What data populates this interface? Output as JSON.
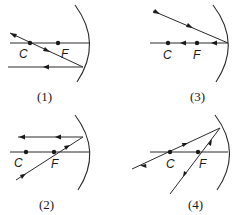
{
  "figure": {
    "panels": [
      {
        "id": "1",
        "label": "(1)",
        "points": {
          "c": "C",
          "f": "F"
        },
        "rays": [
          "incident ray through C reflecting parallel to axis",
          "axis"
        ]
      },
      {
        "id": "2",
        "label": "(2)",
        "points": {
          "c": "C",
          "f": "F"
        },
        "rays": [
          "incident ray through F reflecting parallel to axis",
          "axis"
        ]
      },
      {
        "id": "3",
        "label": "(3)",
        "points": {
          "c": "C",
          "f": "F"
        },
        "rays": [
          "oblique incident ray at vertex",
          "ray along axis reflecting back"
        ]
      },
      {
        "id": "4",
        "label": "(4)",
        "points": {
          "c": "C",
          "f": "F"
        },
        "rays": [
          "ray through C reflecting back on itself",
          "ray through F"
        ]
      }
    ]
  }
}
